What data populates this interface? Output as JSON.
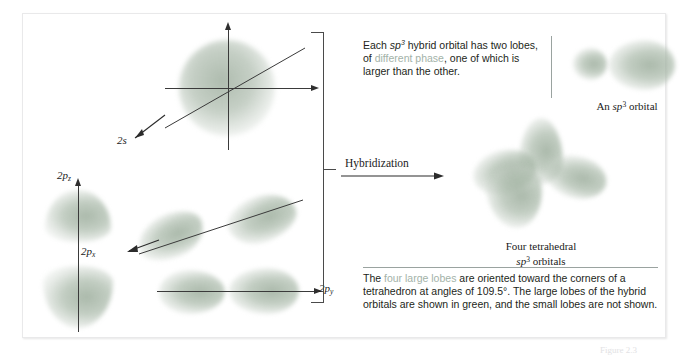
{
  "figure": {
    "left_panel": {
      "orbital_labels": [
        {
          "name": "2s",
          "base": "2",
          "sub": "s",
          "subscript": ""
        },
        {
          "name": "2pz",
          "base": "2",
          "sub": "p",
          "subscript": "z"
        },
        {
          "name": "2px",
          "base": "2",
          "sub": "p",
          "subscript": "x"
        },
        {
          "name": "2py",
          "base": "2",
          "sub": "p",
          "subscript": "y"
        }
      ]
    },
    "hybridization_arrow": {
      "label": "Hybridization"
    },
    "top_text": {
      "segments": [
        {
          "text": "Each ",
          "style": "plain"
        },
        {
          "text": "sp",
          "style": "italic"
        },
        {
          "text": "3",
          "style": "superscript"
        },
        {
          "text": " hybrid orbital has two lobes, of ",
          "style": "plain"
        },
        {
          "text": "different phase",
          "style": "highlight"
        },
        {
          "text": ", one of which is larger than the other.",
          "style": "plain"
        }
      ],
      "plain_text": "Each sp3 hybrid orbital has two lobes, of different phase, one of which is larger than the other."
    },
    "bottom_text": {
      "segments": [
        {
          "text": "The ",
          "style": "plain"
        },
        {
          "text": "four large lobes",
          "style": "highlight"
        },
        {
          "text": " are oriented toward the corners of a tetrahedron at angles of 109.5°. The large lobes of the hybrid orbitals are shown in green, and the small lobes are not shown.",
          "style": "plain"
        }
      ],
      "plain_text": "The four large lobes are oriented toward the corners of a tetrahedron at angles of 109.5°. The large lobes of the hybrid orbitals are shown in green, and the small lobes are not shown."
    },
    "single_orbital_caption": {
      "prefix": "An ",
      "italic": "sp",
      "superscript": "3",
      "suffix": " orbital"
    },
    "tetrahedral_caption": {
      "line1": "Four tetrahedral",
      "line2_italic": "sp",
      "line2_superscript": "3",
      "line2_suffix": " orbitals"
    },
    "figure_number": {
      "label": "Figure 2.3",
      "italic": "",
      "superscript": ""
    },
    "colors": {
      "lobe_green": "#96a896",
      "highlight_text": "#a3b2a8",
      "body_text": "#231f20",
      "rule": "#9aa3a0",
      "axis": "#3a3a3a",
      "panel_border": "#e9e9ea"
    }
  }
}
